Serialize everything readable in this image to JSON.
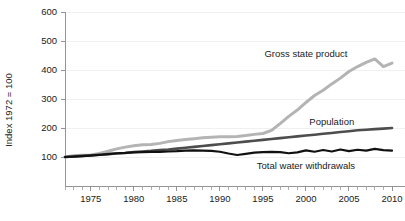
{
  "chart_data": {
    "type": "line",
    "title": "",
    "xlabel": "",
    "ylabel": "Index 1972 = 100",
    "xlim": [
      1972,
      2010
    ],
    "ylim": [
      0,
      600
    ],
    "grid": true,
    "legend_position": "inline-labels",
    "y_ticks": [
      100,
      200,
      300,
      400,
      500,
      600
    ],
    "x_ticks": [
      1975,
      1980,
      1985,
      1990,
      1995,
      2000,
      2005,
      2010
    ],
    "x_minor_tick_step": 1,
    "x": [
      1972,
      1973,
      1974,
      1975,
      1976,
      1977,
      1978,
      1979,
      1980,
      1981,
      1982,
      1983,
      1984,
      1985,
      1986,
      1987,
      1988,
      1989,
      1990,
      1991,
      1992,
      1993,
      1994,
      1995,
      1996,
      1997,
      1998,
      1999,
      2000,
      2001,
      2002,
      2003,
      2004,
      2005,
      2006,
      2007,
      2008,
      2009,
      2010
    ],
    "series": [
      {
        "name": "Gross state product",
        "color": "#b4b4b4",
        "label_x": 2000,
        "label_y": 455,
        "values": [
          100,
          104,
          106,
          107,
          112,
          120,
          128,
          134,
          139,
          142,
          143,
          147,
          153,
          157,
          160,
          163,
          166,
          168,
          170,
          170,
          171,
          174,
          178,
          181,
          192,
          215,
          240,
          262,
          288,
          312,
          330,
          352,
          372,
          395,
          412,
          426,
          438,
          412,
          424
        ]
      },
      {
        "name": "Population",
        "color": "#4d4d4d",
        "label_x": 2003,
        "label_y": 222,
        "values": [
          100,
          102,
          104,
          106,
          108,
          110,
          112,
          114,
          117,
          119,
          121,
          124,
          126,
          129,
          132,
          135,
          138,
          141,
          144,
          147,
          150,
          153,
          156,
          159,
          162,
          165,
          168,
          171,
          174,
          177,
          180,
          183,
          186,
          189,
          192,
          194,
          196,
          198,
          200
        ]
      },
      {
        "name": "Total water withdrawals",
        "color": "#111111",
        "label_x": 2000,
        "label_y": 72,
        "values": [
          100,
          101,
          103,
          105,
          107,
          110,
          113,
          114,
          116,
          117,
          118,
          118,
          119,
          120,
          122,
          123,
          122,
          121,
          118,
          112,
          107,
          111,
          115,
          117,
          118,
          117,
          113,
          116,
          123,
          118,
          124,
          119,
          126,
          120,
          125,
          122,
          128,
          124,
          122
        ]
      }
    ]
  }
}
